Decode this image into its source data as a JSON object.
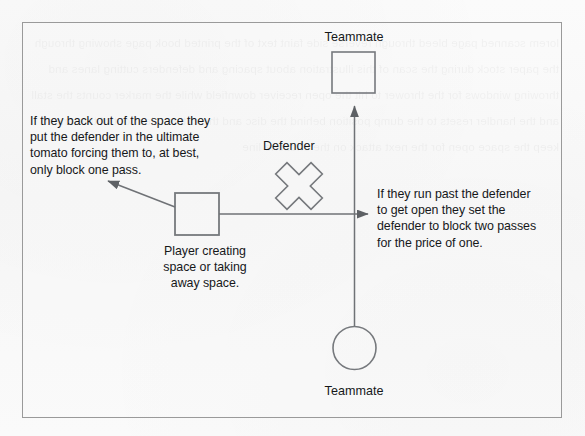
{
  "diagram": {
    "frame": {
      "stroke": "#9a9a9a"
    },
    "ink_color": "#16181a",
    "line_color": "#6f7276",
    "labels": {
      "teammate_top": "Teammate",
      "teammate_bottom": "Teammate",
      "defender": "Defender"
    },
    "annotations": {
      "back_out": "If they back out of the space they\nput the defender in the ultimate\ntomato forcing them to, at best,\nonly block one pass.",
      "run_past": "If they run past the defender\nto get open they set the\ndefender to block two passes\nfor the price of one.",
      "player": "Player creating\nspace or taking\naway space."
    },
    "shapes": {
      "teammate_top_shape": "square",
      "teammate_bottom_shape": "circle",
      "defender_shape": "cross-x",
      "player_shape": "square"
    },
    "background_showthrough": "lorem scanned page bleed through reverse side faint text of the printed book page showing through the paper stock during the scan of this illustration about spacing and defenders cutting lanes and throwing windows for the thrower to hit the open receiver downfield while the marker counts the stall and the handler resets to the dump position behind the disc and the cutters clear out of the lane to keep the space open for the next attack on the endzone line"
  }
}
